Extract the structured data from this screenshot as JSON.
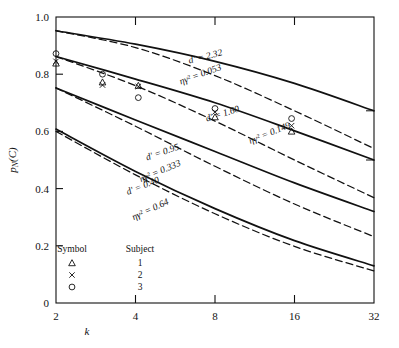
{
  "chart_data": {
    "type": "line",
    "title": "",
    "xlabel": "k",
    "ylabel": "pN(C)",
    "xscale": "log2",
    "xlim": [
      2,
      32
    ],
    "ylim": [
      0,
      1.0
    ],
    "xticks": [
      "2",
      "4",
      "8",
      "16",
      "32"
    ],
    "xtick_values": [
      2,
      4,
      8,
      16,
      32
    ],
    "yticks": [
      "0",
      "0.2",
      "0.4",
      "0.6",
      "0.8",
      "1.0"
    ],
    "ytick_values": [
      0,
      0.2,
      0.4,
      0.6,
      0.8,
      1.0
    ],
    "grid": false,
    "legend_position": "lower-left-inside",
    "series": [
      {
        "name": "d' = 2.32 (solid)",
        "style": "solid",
        "label": "d' = 2.32",
        "x": [
          2,
          4,
          8,
          16,
          32
        ],
        "values": [
          0.952,
          0.905,
          0.845,
          0.768,
          0.672
        ]
      },
      {
        "name": "eta gamma^2 = 0.053 (dashed)",
        "style": "dashed",
        "label": "ηγ² = 0.053",
        "x": [
          2,
          4,
          8,
          16,
          32
        ],
        "values": [
          0.952,
          0.893,
          0.795,
          0.672,
          0.54
        ]
      },
      {
        "name": "d' = 1.60 (solid)",
        "style": "solid",
        "label": "d' = 1.60",
        "x": [
          2,
          4,
          8,
          16,
          32
        ],
        "values": [
          0.862,
          0.783,
          0.7,
          0.602,
          0.5
        ]
      },
      {
        "name": "eta gamma^2 = 0.149 (dashed)",
        "style": "dashed",
        "label": "ηγ² = 0.149",
        "x": [
          2,
          4,
          8,
          16,
          32
        ],
        "values": [
          0.862,
          0.76,
          0.636,
          0.5,
          0.368
        ]
      },
      {
        "name": "d' = 0.95 (solid)",
        "style": "solid",
        "label": "d' = 0.95",
        "x": [
          2,
          4,
          8,
          16,
          32
        ],
        "values": [
          0.752,
          0.64,
          0.53,
          0.42,
          0.32
        ]
      },
      {
        "name": "eta gamma^2 = 0.333 (dashed)",
        "style": "dashed",
        "label": "ηγ² = 0.333",
        "x": [
          2,
          4,
          8,
          16,
          32
        ],
        "values": [
          0.752,
          0.618,
          0.478,
          0.346,
          0.232
        ]
      },
      {
        "name": "d' = 0.40 (solid)",
        "style": "solid",
        "label": "d' = 0.40",
        "x": [
          2,
          4,
          8,
          16,
          32
        ],
        "values": [
          0.608,
          0.46,
          0.33,
          0.218,
          0.13
        ]
      },
      {
        "name": "eta gamma^2 = 0.64 (dashed)",
        "style": "dashed",
        "label": "ηγ² = 0.64",
        "x": [
          2,
          4,
          8,
          16,
          32
        ],
        "values": [
          0.6,
          0.448,
          0.312,
          0.198,
          0.112
        ]
      }
    ],
    "annotations": [
      {
        "text": "d' = 2.32",
        "x": 7.4,
        "y": 0.852,
        "rotation": -14
      },
      {
        "text": "ηγ² = 0.053",
        "x": 7.1,
        "y": 0.79,
        "rotation": -20
      },
      {
        "text": "d' = 1.60",
        "x": 8.6,
        "y": 0.652,
        "rotation": -17
      },
      {
        "text": "ηγ² = 0.149",
        "x": 13.0,
        "y": 0.585,
        "rotation": -22
      },
      {
        "text": "d' = 0.95",
        "x": 5.1,
        "y": 0.518,
        "rotation": -19
      },
      {
        "text": "ηγ² = 0.333",
        "x": 5.0,
        "y": 0.452,
        "rotation": -23
      },
      {
        "text": "d' = 0.40",
        "x": 4.3,
        "y": 0.4,
        "rotation": -22
      },
      {
        "text": "ηγ² = 0.64",
        "x": 4.6,
        "y": 0.318,
        "rotation": -25
      }
    ],
    "scatter": [
      {
        "subject": "3",
        "marker": "circle",
        "x": 2,
        "y": 0.872
      },
      {
        "subject": "2",
        "marker": "cross",
        "x": 2,
        "y": 0.845
      },
      {
        "subject": "1",
        "marker": "triangle",
        "x": 2,
        "y": 0.838
      },
      {
        "subject": "3",
        "marker": "circle",
        "x": 3,
        "y": 0.8
      },
      {
        "subject": "1",
        "marker": "triangle",
        "x": 3,
        "y": 0.772
      },
      {
        "subject": "2",
        "marker": "cross",
        "x": 3,
        "y": 0.762
      },
      {
        "subject": "1",
        "marker": "triangle",
        "x": 4.1,
        "y": 0.76
      },
      {
        "subject": "2",
        "marker": "cross",
        "x": 4.1,
        "y": 0.757
      },
      {
        "subject": "3",
        "marker": "circle",
        "x": 4.1,
        "y": 0.718
      },
      {
        "subject": "3",
        "marker": "circle",
        "x": 8,
        "y": 0.68
      },
      {
        "subject": "2",
        "marker": "cross",
        "x": 8,
        "y": 0.668
      },
      {
        "subject": "1",
        "marker": "triangle",
        "x": 8,
        "y": 0.65
      },
      {
        "subject": "3",
        "marker": "circle",
        "x": 15.6,
        "y": 0.645
      },
      {
        "subject": "2",
        "marker": "cross",
        "x": 15.6,
        "y": 0.62
      },
      {
        "subject": "1",
        "marker": "triangle",
        "x": 15.6,
        "y": 0.6
      }
    ],
    "legend": {
      "header_symbol": "Symbol",
      "header_subject": "Subject",
      "rows": [
        {
          "marker": "triangle",
          "subject": "1"
        },
        {
          "marker": "cross",
          "subject": "2"
        },
        {
          "marker": "circle",
          "subject": "3"
        }
      ]
    }
  },
  "colors": {
    "ink": "#111111",
    "background": "#ffffff"
  }
}
